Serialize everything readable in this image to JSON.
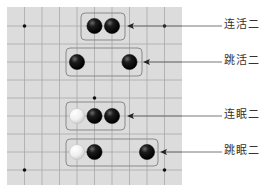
{
  "board": {
    "x0": 7,
    "y0": 7,
    "x1": 182,
    "y1": 185,
    "background": "#dcdcdc",
    "grid_color": "#a8a8a8",
    "cols_x": [
      7,
      24.5,
      42,
      59.5,
      77,
      94.5,
      112,
      129.5,
      147,
      164.5,
      182
    ],
    "rows_y": [
      8,
      26,
      44,
      62,
      80,
      98,
      116,
      134,
      152,
      170,
      185
    ],
    "star_points": [
      [
        24.5,
        26
      ],
      [
        164.5,
        26
      ],
      [
        94.5,
        98
      ],
      [
        24.5,
        170
      ],
      [
        164.5,
        170
      ]
    ]
  },
  "patterns": [
    {
      "name": "连活二",
      "box": [
        81,
        13,
        125,
        40
      ],
      "stones": [
        {
          "color": "black",
          "x": 94.5,
          "y": 26
        },
        {
          "color": "black",
          "x": 112,
          "y": 26
        }
      ],
      "line_y": 26,
      "arrow_x": 127
    },
    {
      "name": "跳活二",
      "box": [
        66,
        48,
        142,
        76
      ],
      "stones": [
        {
          "color": "black",
          "x": 77,
          "y": 62
        },
        {
          "color": "black",
          "x": 129.5,
          "y": 62
        }
      ],
      "line_y": 62,
      "arrow_x": 143
    },
    {
      "name": "连眠二",
      "box": [
        66,
        102,
        125,
        130
      ],
      "stones": [
        {
          "color": "white",
          "x": 77,
          "y": 116
        },
        {
          "color": "black",
          "x": 94.5,
          "y": 116
        },
        {
          "color": "black",
          "x": 112,
          "y": 116
        }
      ],
      "line_y": 116,
      "arrow_x": 127
    },
    {
      "name": "跳眠二",
      "box": [
        66,
        139,
        158,
        166
      ],
      "stones": [
        {
          "color": "white",
          "x": 77,
          "y": 152
        },
        {
          "color": "black",
          "x": 94.5,
          "y": 152
        },
        {
          "color": "black",
          "x": 147,
          "y": 152
        }
      ],
      "line_y": 152,
      "arrow_x": 160
    }
  ],
  "labels": [
    "连活二",
    "跳活二",
    "连眠二",
    "跳眠二"
  ],
  "label_x": 224,
  "line_end_x": 222,
  "colors": {
    "black_stone": "#111111",
    "white_stone": "#f4f4f4",
    "box_stroke": "#8a8a8a",
    "leader": "#555555"
  }
}
